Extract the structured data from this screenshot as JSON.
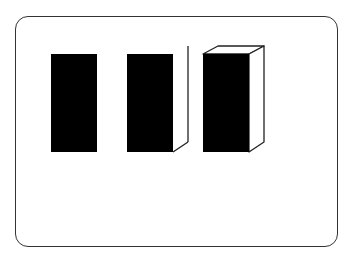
{
  "diagram": {
    "title": "",
    "colors": {
      "frame_stroke": "#333333",
      "fill": "#000000",
      "face_fill": "#ffffff",
      "edge_stroke": "#222222"
    },
    "shapes": [
      {
        "id": "flat-rectangle",
        "label": "",
        "stage": "2D face only"
      },
      {
        "id": "rectangle-with-side",
        "label": "",
        "stage": "front face + side face"
      },
      {
        "id": "full-box",
        "label": "",
        "stage": "front + side + top faces"
      }
    ]
  }
}
